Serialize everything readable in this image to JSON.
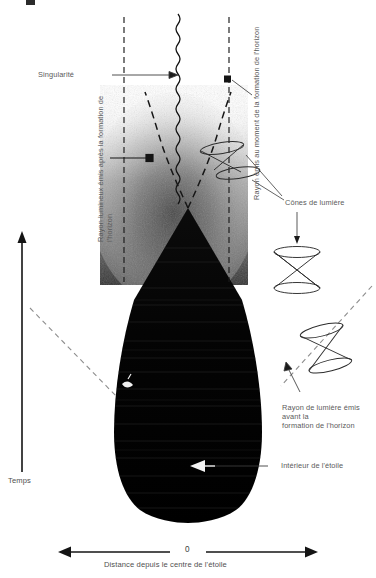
{
  "figure": {
    "type": "spacetime-diagram",
    "background_color": "#ffffff",
    "ink_color": "#111111",
    "label_color": "#5a5a5a"
  },
  "labels": {
    "singularity": "Singularité",
    "ray_after_horizon": "Rayon lumineux émis après la formation de l'horizon",
    "ray_at_horizon": "Rayon émis au moment de la formation de l'horizon",
    "light_cones": "Cônes de lumière",
    "ray_before_horizon_line1": "Rayon de lumière émis avant la",
    "ray_before_horizon_line2": "formation de l'horizon",
    "star_interior": "Intérieur de l'étoile"
  },
  "axes": {
    "time_label": "Temps",
    "distance_label": "Distance depuis le centre de l'étoile",
    "origin_tick": "0",
    "time_direction": "up",
    "distance_direction": "bidirectional"
  },
  "elements": {
    "singularity_line": "wavy-vertical-line",
    "event_horizon_left": "dashed-vertical-line",
    "event_horizon_right": "dashed-vertical-line",
    "light_ray_left": "dashed-curve",
    "light_ray_right": "dashed-curve",
    "collapsing_star": "black-filled-region",
    "light_cone_upper": "hourglass-cone",
    "light_cone_lower": "tilted-hourglass-cone",
    "radiation_field": "grey-noise-gradient"
  },
  "colors": {
    "accent_dark": "#111111",
    "dashed": "#1a1a1a",
    "text": "#5a5a5a",
    "star_fill": "#050505"
  }
}
